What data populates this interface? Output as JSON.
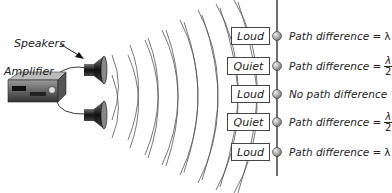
{
  "diagram": {
    "labels": {
      "speakers": "Speakers",
      "amplifier": "Amplifier"
    },
    "rows": [
      {
        "state": "Loud",
        "relation": "Path difference = ",
        "symbol": "λ",
        "fraction": false
      },
      {
        "state": "Quiet",
        "relation": "Path difference = ",
        "symbol": "λ",
        "denominator": "2",
        "fraction": true
      },
      {
        "state": "Loud",
        "relation": "No path difference",
        "symbol": "",
        "fraction": false
      },
      {
        "state": "Quiet",
        "relation": "Path difference = ",
        "symbol": "λ",
        "denominator": "2",
        "fraction": true
      },
      {
        "state": "Loud",
        "relation": "Path difference = ",
        "symbol": "λ",
        "fraction": false
      }
    ],
    "colors": {
      "line": "#555555",
      "text": "#222222",
      "speaker_dark": "#222222",
      "detector": "#aaaaaa"
    }
  }
}
